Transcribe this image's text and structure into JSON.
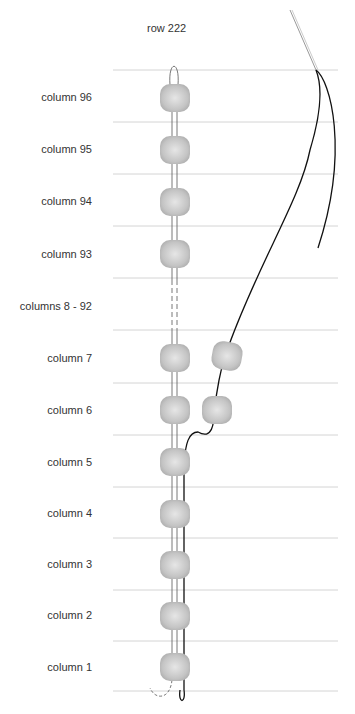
{
  "diagram": {
    "title": "row 222",
    "rows": [
      {
        "label": "column 96",
        "y": 97
      },
      {
        "label": "column 95",
        "y": 149
      },
      {
        "label": "column 94",
        "y": 201
      },
      {
        "label": "column 93",
        "y": 254
      },
      {
        "label": "columns 8 - 92",
        "y": 306
      },
      {
        "label": "column 7",
        "y": 358
      },
      {
        "label": "column 6",
        "y": 410
      },
      {
        "label": "column 5",
        "y": 462
      },
      {
        "label": "column 4",
        "y": 513
      },
      {
        "label": "column 3",
        "y": 564
      },
      {
        "label": "column 2",
        "y": 615
      },
      {
        "label": "column 1",
        "y": 667
      }
    ],
    "colors": {
      "bead": "#c9c9c9",
      "line": "#d0d0d0",
      "thread": "#111111"
    }
  }
}
